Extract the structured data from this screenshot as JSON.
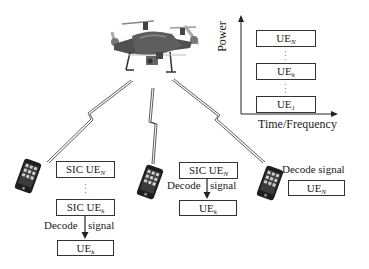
{
  "diagram": {
    "uav": {
      "icon": "drone-icon"
    },
    "power_chart": {
      "y_axis_label": "Power",
      "x_axis_label": "Time/Frequency",
      "levels": [
        {
          "base": "UE",
          "sub": "N"
        },
        {
          "base": "UE",
          "sub": "k"
        },
        {
          "base": "UE",
          "sub": "1"
        }
      ],
      "ellipsis": "⋮"
    },
    "users": [
      {
        "name": "left-user",
        "icon": "smartphone-icon",
        "steps": [
          {
            "base": "SIC UE",
            "sub": "N"
          },
          {
            "base": "SIC UE",
            "sub": "k"
          }
        ],
        "decode_label_left": "Decode",
        "decode_label_right": "signal",
        "result": {
          "base": "UE",
          "sub": "k"
        }
      },
      {
        "name": "middle-user",
        "icon": "smartphone-icon",
        "steps": [
          {
            "base": "SIC UE",
            "sub": "N"
          }
        ],
        "decode_label_left": "Decode",
        "decode_label_right": "signal",
        "result": {
          "base": "UE",
          "sub": "k"
        }
      },
      {
        "name": "right-user",
        "icon": "smartphone-icon",
        "decode_label": "Decode signal",
        "result": {
          "base": "UE",
          "sub": "N"
        }
      }
    ],
    "links": [
      "wireless-link-icon",
      "wireless-link-icon",
      "wireless-link-icon"
    ],
    "colors": {
      "line": "#333333",
      "drone_body": "#5a5a5a",
      "phone": "#1e1e1e",
      "background": "#ffffff"
    }
  }
}
